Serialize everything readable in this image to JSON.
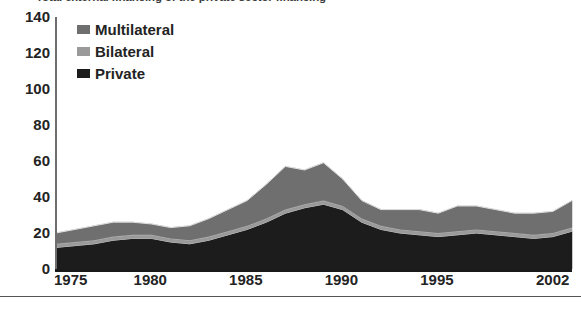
{
  "caption": {
    "clipped_text": "Total external financing of the private sector financing"
  },
  "legend": {
    "position": "top-left-inside",
    "items": [
      {
        "label": "Multilateral",
        "color": "#6f6f6f",
        "swatch_name": "legend-swatch-multilateral"
      },
      {
        "label": "Bilateral",
        "color": "#9a9a9a",
        "swatch_name": "legend-swatch-bilateral"
      },
      {
        "label": "Private",
        "color": "#1c1c1c",
        "swatch_name": "legend-swatch-private"
      }
    ]
  },
  "axes": {
    "y_ticks": [
      "140",
      "120",
      "100",
      "80",
      "60",
      "40",
      "20",
      "0"
    ],
    "x_ticks": [
      "1975",
      "1980",
      "1985",
      "1990",
      "1995",
      "2002"
    ]
  },
  "chart_data": {
    "type": "area",
    "stacked": true,
    "title": "",
    "xlabel": "",
    "ylabel": "",
    "xlim": [
      1975,
      2002
    ],
    "ylim": [
      0,
      140
    ],
    "grid": false,
    "legend_position": "top-left-inside",
    "x": [
      1975,
      1976,
      1977,
      1978,
      1979,
      1980,
      1981,
      1982,
      1983,
      1984,
      1985,
      1986,
      1987,
      1988,
      1989,
      1990,
      1991,
      1992,
      1993,
      1994,
      1995,
      1996,
      1997,
      1998,
      1999,
      2000,
      2001,
      2002
    ],
    "categories": [
      "1975",
      "1976",
      "1977",
      "1978",
      "1979",
      "1980",
      "1981",
      "1982",
      "1983",
      "1984",
      "1985",
      "1986",
      "1987",
      "1988",
      "1989",
      "1990",
      "1991",
      "1992",
      "1993",
      "1994",
      "1995",
      "1996",
      "1997",
      "1998",
      "1999",
      "2000",
      "2001",
      "2002"
    ],
    "series": [
      {
        "name": "Private",
        "color": "#1c1c1c",
        "values": [
          12,
          13,
          14,
          16,
          17,
          17,
          15,
          14,
          16,
          19,
          22,
          26,
          31,
          34,
          36,
          33,
          26,
          22,
          20,
          19,
          18,
          19,
          20,
          19,
          18,
          17,
          18,
          21
        ]
      },
      {
        "name": "Bilateral",
        "color": "#9a9a9a",
        "values": [
          2,
          2,
          2,
          2,
          2,
          2,
          2,
          2,
          2,
          2,
          2,
          2,
          2,
          2,
          2,
          2,
          2,
          2,
          2,
          2,
          2,
          2,
          2,
          2,
          2,
          2,
          2,
          2
        ]
      },
      {
        "name": "Multilateral",
        "color": "#6f6f6f",
        "values": [
          6,
          7,
          8,
          8,
          7,
          6,
          6,
          8,
          10,
          12,
          14,
          19,
          24,
          19,
          21,
          15,
          10,
          9,
          11,
          12,
          11,
          14,
          13,
          12,
          11,
          12,
          12,
          15
        ]
      }
    ],
    "totals": [
      20,
      22,
      24,
      26,
      26,
      25,
      23,
      24,
      28,
      33,
      38,
      47,
      57,
      55,
      59,
      50,
      38,
      33,
      33,
      33,
      31,
      35,
      35,
      33,
      31,
      31,
      32,
      38
    ]
  }
}
